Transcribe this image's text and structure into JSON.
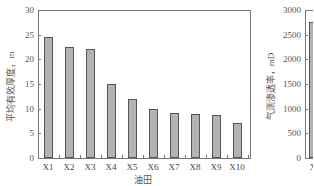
{
  "chart_data": [
    {
      "type": "bar",
      "title": "",
      "xlabel": "油田",
      "ylabel": "平均有效厚度，m",
      "ylim": [
        0,
        30
      ],
      "yticks": [
        0,
        5,
        10,
        15,
        20,
        25,
        30
      ],
      "categories": [
        "X1",
        "X2",
        "X3",
        "X4",
        "X5",
        "X6",
        "X7",
        "X8",
        "X9",
        "X10"
      ],
      "values": [
        24.6,
        22.6,
        22.0,
        15.0,
        12.0,
        9.9,
        9.1,
        8.9,
        8.7,
        7.1
      ],
      "grid": false,
      "legend": null,
      "bar_color": "#b3b3b3"
    },
    {
      "type": "bar",
      "title": "",
      "xlabel": "",
      "ylabel": "气测渗透率，mD",
      "ylim": [
        0,
        3000
      ],
      "yticks": [
        0,
        500,
        1000,
        1500,
        2000,
        2500,
        3000
      ],
      "categories": [
        "X"
      ],
      "values": [
        2750
      ],
      "grid": false,
      "legend": null,
      "bar_color": "#b3b3b3",
      "note": "chart cut off at right edge; only first bar partially visible"
    }
  ],
  "labels": {
    "chart1": {
      "xlabel": "油田",
      "ylabel": "平均有效厚度，m",
      "yticks": [
        "0",
        "5",
        "10",
        "15",
        "20",
        "25",
        "30"
      ],
      "xticks": [
        "X1",
        "X2",
        "X3",
        "X4",
        "X5",
        "X6",
        "X7",
        "X8",
        "X9",
        "X10"
      ]
    },
    "chart2": {
      "ylabel": "气测渗透率，mD",
      "yticks": [
        "0",
        "500",
        "1000",
        "1500",
        "2000",
        "2500",
        "3000"
      ],
      "xticks": [
        "X"
      ]
    }
  }
}
